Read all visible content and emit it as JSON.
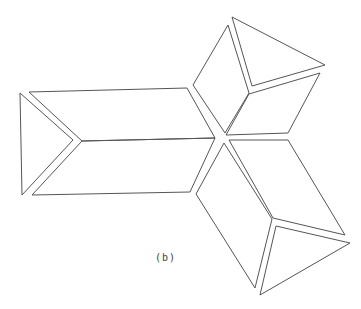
{
  "figure": {
    "label": "(b)",
    "stroke_color": "#555555",
    "background": "#ffffff",
    "label_position": {
      "x": 155,
      "y": 252
    }
  },
  "groups": [
    {
      "name": "left-group",
      "shapes": [
        {
          "name": "left-triangle",
          "points": [
            [
              20,
              93
            ],
            [
              73,
              140
            ],
            [
              22,
              195
            ]
          ]
        },
        {
          "name": "left-upper-parallelogram",
          "points": [
            [
              29,
              92
            ],
            [
              187,
              88
            ],
            [
              215,
              138
            ],
            [
              82,
              141
            ]
          ]
        },
        {
          "name": "left-lower-parallelogram",
          "points": [
            [
              82,
              141
            ],
            [
              215,
              138
            ],
            [
              190,
              192
            ],
            [
              32,
              195
            ]
          ]
        }
      ]
    },
    {
      "name": "top-group",
      "shapes": [
        {
          "name": "top-triangle",
          "points": [
            [
              232,
              17
            ],
            [
              325,
              65
            ],
            [
              252,
              86
            ]
          ]
        },
        {
          "name": "top-left-parallelogram",
          "points": [
            [
              228,
              25
            ],
            [
              249,
              93
            ],
            [
              225,
              133
            ],
            [
              193,
              85
            ]
          ]
        },
        {
          "name": "top-right-parallelogram",
          "points": [
            [
              249,
              94
            ],
            [
              320,
              73
            ],
            [
              288,
              133
            ],
            [
              226,
              135
            ]
          ]
        }
      ]
    },
    {
      "name": "bottom-group",
      "shapes": [
        {
          "name": "bottom-triangle",
          "points": [
            [
              276,
              226
            ],
            [
              350,
              243
            ],
            [
              260,
              295
            ]
          ]
        },
        {
          "name": "bottom-left-parallelogram",
          "points": [
            [
              224,
              143
            ],
            [
              272,
              219
            ],
            [
              255,
              288
            ],
            [
              196,
              194
            ]
          ]
        },
        {
          "name": "bottom-right-parallelogram",
          "points": [
            [
              229,
              140
            ],
            [
              288,
              140
            ],
            [
              345,
              235
            ],
            [
              273,
              218
            ]
          ]
        }
      ]
    }
  ]
}
